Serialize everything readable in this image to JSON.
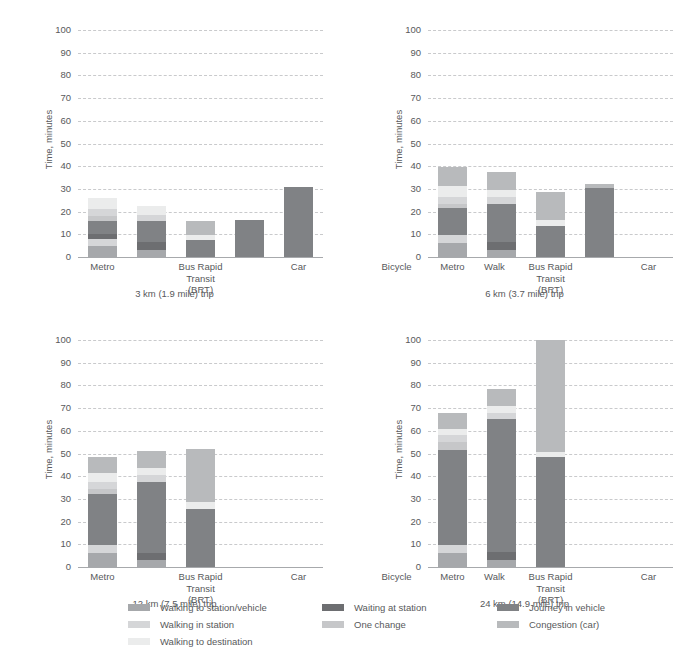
{
  "chart_data": {
    "type": "bar",
    "subtype": "stacked-bar-small-multiples",
    "title": "",
    "ylabel": "Time, minutes",
    "xlabel": "",
    "ylim": [
      0,
      100
    ],
    "yticks": [
      0,
      10,
      20,
      30,
      40,
      50,
      60,
      70,
      80,
      90,
      100
    ],
    "grid": true,
    "legend_position": "bottom",
    "categories": [
      "Metro",
      "Bus Rapid\nTransit (BRT)",
      "Car",
      "Bicycle",
      "Walk"
    ],
    "series_names": [
      "Walking to station/vehicle",
      "Walking in station",
      "Walking to destination",
      "Waiting at station",
      "One change",
      "Journey in vehicle",
      "Congestion (car)"
    ],
    "series_colors": {
      "Walking to station/vehicle": "#a6a8ab",
      "Walking in station": "#d5d6d8",
      "Walking to destination": "#ebecec",
      "Waiting at station": "#6d6e71",
      "One change": "#c6c7c9",
      "Journey in vehicle": "#808285",
      "Congestion (car)": "#b8babc"
    },
    "panels": [
      {
        "caption": "3 km (1.9 mile) trip",
        "bars": [
          {
            "category": "Metro",
            "total": 26,
            "stack": [
              {
                "name": "Walking to station/vehicle",
                "value": 5
              },
              {
                "name": "Walking in station",
                "value": 3
              },
              {
                "name": "Waiting at station",
                "value": 2
              },
              {
                "name": "Journey in vehicle",
                "value": 6
              },
              {
                "name": "One change",
                "value": 2
              },
              {
                "name": "Walking in station",
                "value": 3
              },
              {
                "name": "Walking to destination",
                "value": 5
              }
            ]
          },
          {
            "category": "Bus Rapid\nTransit (BRT)",
            "total": 22.5,
            "stack": [
              {
                "name": "Walking to station/vehicle",
                "value": 3
              },
              {
                "name": "Waiting at station",
                "value": 3.5
              },
              {
                "name": "Journey in vehicle",
                "value": 9.5
              },
              {
                "name": "Walking in station",
                "value": 2.5
              },
              {
                "name": "Walking to destination",
                "value": 4
              }
            ]
          },
          {
            "category": "Car",
            "total": 16,
            "stack": [
              {
                "name": "Journey in vehicle",
                "value": 7.5
              },
              {
                "name": "Walking to destination",
                "value": 2
              },
              {
                "name": "Congestion (car)",
                "value": 6.5
              }
            ]
          },
          {
            "category": "Bicycle",
            "total": 16.5,
            "stack": [
              {
                "name": "Journey in vehicle",
                "value": 16.5
              }
            ]
          },
          {
            "category": "Walk",
            "total": 31,
            "stack": [
              {
                "name": "Journey in vehicle",
                "value": 31
              }
            ]
          }
        ]
      },
      {
        "caption": "6 km (3.7 mile) trip",
        "bars": [
          {
            "category": "Metro",
            "total": 39.5,
            "stack": [
              {
                "name": "Walking to station/vehicle",
                "value": 6
              },
              {
                "name": "Walking in station",
                "value": 3.5
              },
              {
                "name": "Journey in vehicle",
                "value": 12
              },
              {
                "name": "One change",
                "value": 2
              },
              {
                "name": "Walking in station",
                "value": 3
              },
              {
                "name": "Walking to destination",
                "value": 5
              },
              {
                "name": "Congestion (car)",
                "value": 8
              }
            ]
          },
          {
            "category": "Bus Rapid\nTransit (BRT)",
            "total": 37.5,
            "stack": [
              {
                "name": "Walking to station/vehicle",
                "value": 3
              },
              {
                "name": "Waiting at station",
                "value": 3.5
              },
              {
                "name": "Journey in vehicle",
                "value": 17
              },
              {
                "name": "Walking in station",
                "value": 3
              },
              {
                "name": "Walking to destination",
                "value": 3
              },
              {
                "name": "Congestion (car)",
                "value": 8
              }
            ]
          },
          {
            "category": "Car",
            "total": 28.5,
            "stack": [
              {
                "name": "Journey in vehicle",
                "value": 13.5
              },
              {
                "name": "Walking to destination",
                "value": 3
              },
              {
                "name": "Congestion (car)",
                "value": 12
              }
            ]
          },
          {
            "category": "Bicycle",
            "total": 32,
            "stack": [
              {
                "name": "Journey in vehicle",
                "value": 30.5
              },
              {
                "name": "Congestion (car)",
                "value": 1.5
              }
            ]
          },
          {
            "category": "Walk",
            "total": 0,
            "stack": []
          }
        ]
      },
      {
        "caption": "12 km (7.5 mile) trip",
        "bars": [
          {
            "category": "Metro",
            "total": 48.5,
            "stack": [
              {
                "name": "Walking to station/vehicle",
                "value": 6
              },
              {
                "name": "Walking in station",
                "value": 3.5
              },
              {
                "name": "Journey in vehicle",
                "value": 22.5
              },
              {
                "name": "One change",
                "value": 2.5
              },
              {
                "name": "Walking in station",
                "value": 3
              },
              {
                "name": "Walking to destination",
                "value": 4
              },
              {
                "name": "Congestion (car)",
                "value": 7
              }
            ]
          },
          {
            "category": "Bus Rapid\nTransit (BRT)",
            "total": 51,
            "stack": [
              {
                "name": "Walking to station/vehicle",
                "value": 3
              },
              {
                "name": "Waiting at station",
                "value": 3
              },
              {
                "name": "Journey in vehicle",
                "value": 31.5
              },
              {
                "name": "Walking in station",
                "value": 3
              },
              {
                "name": "Walking to destination",
                "value": 3
              },
              {
                "name": "Congestion (car)",
                "value": 7.5
              }
            ]
          },
          {
            "category": "Car",
            "total": 52,
            "stack": [
              {
                "name": "Journey in vehicle",
                "value": 25.5
              },
              {
                "name": "Walking to destination",
                "value": 3
              },
              {
                "name": "Congestion (car)",
                "value": 23.5
              }
            ]
          },
          {
            "category": "Bicycle",
            "total": 0,
            "stack": []
          },
          {
            "category": "Walk",
            "total": 0,
            "stack": []
          }
        ]
      },
      {
        "caption": "24 km (14.9 mile) trip",
        "bars": [
          {
            "category": "Metro",
            "total": 68,
            "stack": [
              {
                "name": "Walking to station/vehicle",
                "value": 6
              },
              {
                "name": "Walking in station",
                "value": 3.5
              },
              {
                "name": "Journey in vehicle",
                "value": 42
              },
              {
                "name": "One change",
                "value": 3.5
              },
              {
                "name": "Walking in station",
                "value": 3
              },
              {
                "name": "Walking to destination",
                "value": 3
              },
              {
                "name": "Congestion (car)",
                "value": 7
              }
            ]
          },
          {
            "category": "Bus Rapid\nTransit (BRT)",
            "total": 78.5,
            "stack": [
              {
                "name": "Walking to station/vehicle",
                "value": 3
              },
              {
                "name": "Waiting at station",
                "value": 3.5
              },
              {
                "name": "Journey in vehicle",
                "value": 58.5
              },
              {
                "name": "Walking in station",
                "value": 3
              },
              {
                "name": "Walking to destination",
                "value": 3
              },
              {
                "name": "Congestion (car)",
                "value": 7.5
              }
            ]
          },
          {
            "category": "Car",
            "total": 100,
            "stack": [
              {
                "name": "Journey in vehicle",
                "value": 48.5
              },
              {
                "name": "Walking to destination",
                "value": 2
              },
              {
                "name": "Congestion (car)",
                "value": 49.5
              }
            ]
          },
          {
            "category": "Bicycle",
            "total": 0,
            "stack": []
          },
          {
            "category": "Walk",
            "total": 0,
            "stack": []
          }
        ]
      }
    ]
  },
  "legend": {
    "columns": [
      {
        "items": [
          {
            "label": "Walking to station/vehicle",
            "color": "#a6a8ab"
          },
          {
            "label": "Walking in station",
            "color": "#d5d6d8"
          },
          {
            "label": "Walking to destination",
            "color": "#ebecec"
          }
        ]
      },
      {
        "items": [
          {
            "label": "Waiting at station",
            "color": "#6d6e71"
          },
          {
            "label": "One change",
            "color": "#c6c7c9"
          }
        ]
      },
      {
        "items": [
          {
            "label": "Journey in vehicle",
            "color": "#808285"
          },
          {
            "label": "Congestion (car)",
            "color": "#b8babc"
          }
        ]
      }
    ]
  }
}
